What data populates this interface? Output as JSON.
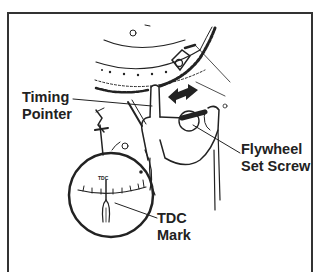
{
  "figure": {
    "type": "technical-illustration",
    "colors": {
      "ink": "#222222",
      "background": "#ffffff",
      "border": "#333333"
    }
  },
  "labels": {
    "timing_pointer": {
      "line1": "Timing",
      "line2": "Pointer"
    },
    "flywheel_set_screw": {
      "line1": "Flywheel",
      "line2": "Set Screw"
    },
    "tdc_mark": {
      "line1": "TDC",
      "line2": "Mark"
    }
  },
  "inset": {
    "scale_label": "TDC"
  }
}
